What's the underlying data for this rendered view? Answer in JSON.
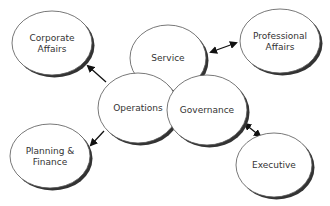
{
  "diagram": {
    "type": "organizational-ellipse-diagram",
    "nodes": [
      {
        "id": "corporate",
        "lines": [
          "Corporate",
          "Affairs"
        ],
        "cx": 52,
        "cy": 43,
        "rx": 40,
        "ry": 32
      },
      {
        "id": "professional",
        "lines": [
          "Professional",
          "Affairs"
        ],
        "cx": 280,
        "cy": 41,
        "rx": 40,
        "ry": 32
      },
      {
        "id": "service",
        "lines": [
          "Service"
        ],
        "cx": 168,
        "cy": 58,
        "rx": 38,
        "ry": 33
      },
      {
        "id": "operations",
        "lines": [
          "Operations"
        ],
        "cx": 138,
        "cy": 108,
        "rx": 40,
        "ry": 35
      },
      {
        "id": "governance",
        "lines": [
          "Governance"
        ],
        "cx": 207,
        "cy": 110,
        "rx": 40,
        "ry": 35
      },
      {
        "id": "planning",
        "lines": [
          "Planning &",
          "Finance"
        ],
        "cx": 50,
        "cy": 156,
        "rx": 40,
        "ry": 32
      },
      {
        "id": "executive",
        "lines": [
          "Executive"
        ],
        "cx": 274,
        "cy": 165,
        "rx": 38,
        "ry": 32
      }
    ],
    "edges": [
      {
        "from": "operations",
        "to": "corporate",
        "direction": "single",
        "x1": 106,
        "y1": 82,
        "x2": 88,
        "y2": 66
      },
      {
        "from": "service",
        "to": "professional",
        "direction": "double",
        "x1": 211,
        "y1": 52,
        "x2": 236,
        "y2": 43
      },
      {
        "from": "operations",
        "to": "planning",
        "direction": "single",
        "x1": 104,
        "y1": 131,
        "x2": 91,
        "y2": 145
      },
      {
        "from": "governance",
        "to": "executive",
        "direction": "double",
        "x1": 245,
        "y1": 124,
        "x2": 260,
        "y2": 136
      }
    ],
    "colors": {
      "stroke": "#555555",
      "fill": "#ffffff",
      "shadow": "#333333",
      "text": "#333333"
    }
  }
}
